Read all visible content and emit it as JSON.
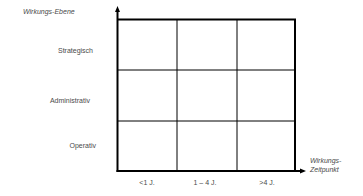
{
  "diagram": {
    "type": "3x3 matrix",
    "y_axis": {
      "title": "Wirkungs-Ebene",
      "categories": [
        "Strategisch",
        "Administrativ",
        "Operativ"
      ]
    },
    "x_axis": {
      "title_line1": "Wirkungs-",
      "title_line2": "Zeitpunkt",
      "categories": [
        "<1 J.",
        "1 – 4 J.",
        ">4 J."
      ]
    },
    "cells": [
      [
        "",
        "",
        ""
      ],
      [
        "",
        "",
        ""
      ],
      [
        "",
        "",
        ""
      ]
    ],
    "colors": {
      "line": "#000000",
      "text": "#4a4a4a",
      "background": "#ffffff"
    }
  }
}
